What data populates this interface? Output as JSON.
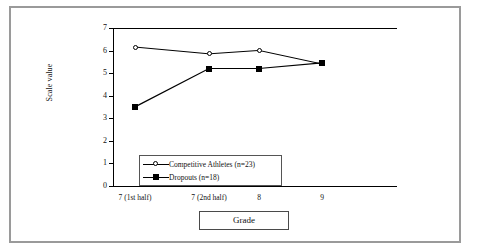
{
  "figure": {
    "border_color": "#9a9a9a",
    "background": "#ffffff"
  },
  "chart_data": {
    "type": "line",
    "title": "",
    "subtitle": "",
    "xlabel": "Grade",
    "ylabel": "Scale value",
    "categories": [
      "7 (1st half)",
      "7 (2nd half)",
      "8",
      "9"
    ],
    "series": [
      {
        "name": "Competitive Athletes (n=23)",
        "marker": "open-circle",
        "color": "#000000",
        "values": [
          6.2,
          5.9,
          6.05,
          5.45
        ]
      },
      {
        "name": "Dropouts (n=18)",
        "marker": "filled-square",
        "color": "#000000",
        "values": [
          3.55,
          5.25,
          5.25,
          5.5
        ]
      }
    ],
    "ylim": [
      0,
      7
    ],
    "yticks": [
      0,
      1,
      2,
      3,
      4,
      5,
      6,
      7
    ],
    "ytick_labels": [
      "0",
      "1",
      "2",
      "3",
      "4",
      "5",
      "6",
      "7"
    ],
    "grid": false,
    "legend_position": "inside-lower-left",
    "legend_entries": [
      "Competitive Athletes (n=23)",
      "Dropouts (n=18)"
    ]
  },
  "axes": {
    "y_title": "Scale value",
    "x_title": "Grade"
  }
}
